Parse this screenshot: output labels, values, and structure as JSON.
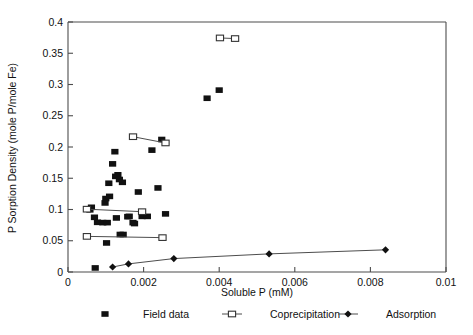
{
  "chart_data": {
    "type": "scatter",
    "title": "",
    "xlabel": "Soluble P  (mM)",
    "ylabel": "P Sorption Density  (mole P/mole Fe)",
    "xlim": [
      0,
      0.01
    ],
    "ylim": [
      0,
      0.4
    ],
    "xticks": [
      0,
      0.002,
      0.004,
      0.006,
      0.008,
      0.01
    ],
    "xtick_labels": [
      "0",
      "0.002",
      "0.004",
      "0.006",
      "0.008",
      "0.01"
    ],
    "yticks": [
      0,
      0.05,
      0.1,
      0.15,
      0.2,
      0.25,
      0.3,
      0.35,
      0.4
    ],
    "ytick_labels": [
      "0",
      "0.05",
      "0.1",
      "0.15",
      "0.2",
      "0.25",
      "0.3",
      "0.35",
      "0.4"
    ],
    "grid": false,
    "legend_position": "below-axes",
    "series": [
      {
        "name": "Field data",
        "marker": "filled-square",
        "connected": false,
        "color": "#111111",
        "points": [
          [
            0.00072,
            0.0065
          ],
          [
            0.00102,
            0.0465
          ],
          [
            0.00062,
            0.1035
          ],
          [
            0.00058,
            0.0995
          ],
          [
            0.0007,
            0.0875
          ],
          [
            0.00078,
            0.0795
          ],
          [
            0.00092,
            0.079
          ],
          [
            0.00104,
            0.079
          ],
          [
            0.00098,
            0.1105
          ],
          [
            0.001,
            0.1175
          ],
          [
            0.0011,
            0.121
          ],
          [
            0.00108,
            0.142
          ],
          [
            0.00118,
            0.173
          ],
          [
            0.00124,
            0.1925
          ],
          [
            0.00126,
            0.153
          ],
          [
            0.00132,
            0.1555
          ],
          [
            0.00136,
            0.148
          ],
          [
            0.00144,
            0.1435
          ],
          [
            0.00128,
            0.0865
          ],
          [
            0.00138,
            0.06
          ],
          [
            0.00146,
            0.06
          ],
          [
            0.00158,
            0.0885
          ],
          [
            0.00162,
            0.089
          ],
          [
            0.00172,
            0.079
          ],
          [
            0.00176,
            0.0775
          ],
          [
            0.00196,
            0.089
          ],
          [
            0.00186,
            0.128
          ],
          [
            0.00222,
            0.195
          ],
          [
            0.00248,
            0.212
          ],
          [
            0.0021,
            0.089
          ],
          [
            0.00238,
            0.1345
          ],
          [
            0.00258,
            0.093
          ],
          [
            0.00368,
            0.278
          ],
          [
            0.004,
            0.291
          ]
        ]
      },
      {
        "name": "Coprecipitation",
        "marker": "open-square",
        "connected": true,
        "color": "#333333",
        "pairs": [
          [
            [
              0.0005,
              0.1005
            ],
            [
              0.00196,
              0.0965
            ]
          ],
          [
            [
              0.0005,
              0.057
            ],
            [
              0.0025,
              0.055
            ]
          ],
          [
            [
              0.00172,
              0.2165
            ],
            [
              0.00258,
              0.2065
            ]
          ],
          [
            [
              0.00402,
              0.3745
            ],
            [
              0.00442,
              0.3735
            ]
          ]
        ]
      },
      {
        "name": "Adsorption",
        "marker": "filled-diamond",
        "connected": true,
        "color": "#111111",
        "points": [
          [
            0.00118,
            0.008
          ],
          [
            0.0016,
            0.013
          ],
          [
            0.0028,
            0.0215
          ],
          [
            0.00532,
            0.029
          ],
          [
            0.0084,
            0.0355
          ]
        ]
      }
    ]
  },
  "legend": {
    "items": [
      {
        "label": "Field data",
        "marker": "filled-square"
      },
      {
        "label": "Coprecipitation",
        "marker": "open-square-line"
      },
      {
        "label": "Adsorption",
        "marker": "filled-diamond-line"
      }
    ]
  }
}
